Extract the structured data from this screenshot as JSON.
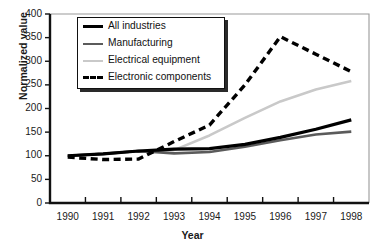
{
  "chart_data": {
    "type": "line",
    "title": "",
    "xlabel": "Year",
    "ylabel": "Normalized value",
    "x": [
      1990,
      1991,
      1992,
      1993,
      1994,
      1995,
      1996,
      1997,
      1998
    ],
    "categories": [
      "1990",
      "1991",
      "1992",
      "1993",
      "1994",
      "1995",
      "1996",
      "1997",
      "1998"
    ],
    "xlim": [
      1989.5,
      1998.5
    ],
    "ylim": [
      0,
      400
    ],
    "yticks": [
      0,
      50,
      100,
      150,
      200,
      250,
      300,
      350,
      400
    ],
    "ytick_labels": [
      "0",
      "50",
      "100",
      "150",
      "200",
      "250",
      "300",
      "350",
      "400"
    ],
    "grid": false,
    "legend_position": "top-left",
    "series": [
      {
        "name": "All industries",
        "color": "#000000",
        "style": "solid",
        "width": 3.2,
        "values": [
          100,
          104,
          110,
          114,
          115,
          124,
          139,
          156,
          176
        ]
      },
      {
        "name": "Manufacturing",
        "color": "#5b5b5b",
        "style": "solid",
        "width": 2.6,
        "values": [
          100,
          104,
          110,
          105,
          108,
          119,
          133,
          145,
          151
        ]
      },
      {
        "name": "Electrical equipment",
        "color": "#c9c9c9",
        "style": "solid",
        "width": 2.6,
        "values": [
          100,
          104,
          110,
          112,
          143,
          180,
          215,
          240,
          258
        ]
      },
      {
        "name": "Electronic components",
        "color": "#000000",
        "style": "dashed",
        "width": 3.4,
        "values": [
          97,
          92,
          93,
          130,
          165,
          250,
          352,
          315,
          278
        ]
      }
    ]
  },
  "axes": {
    "y_title": "Normalized value",
    "x_title": "Year"
  },
  "legend": {
    "items": [
      {
        "label": "All industries",
        "swatch": "solid-black"
      },
      {
        "label": "Manufacturing",
        "swatch": "solid-dark"
      },
      {
        "label": "Electrical equipment",
        "swatch": "solid-light"
      },
      {
        "label": "Electronic components",
        "swatch": "dashed-black"
      }
    ]
  },
  "colors": {
    "all_industries": "#000000",
    "manufacturing": "#5b5b5b",
    "electrical_equipment": "#c9c9c9",
    "electronic_components": "#000000",
    "axis": "#1a1a1a",
    "frame": "#8a8a8a",
    "background": "#ffffff"
  }
}
